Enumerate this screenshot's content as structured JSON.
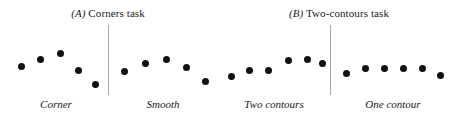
{
  "figure": {
    "panels": [
      {
        "id": "panel-a",
        "letter": "(A)",
        "title": " Corners task"
      },
      {
        "id": "panel-b",
        "letter": "(B)",
        "title": " Two-contours task"
      }
    ],
    "conditions": [
      {
        "id": "corner",
        "label": "Corner"
      },
      {
        "id": "smooth",
        "label": "Smooth"
      },
      {
        "id": "two-contours",
        "label": "Two contours"
      },
      {
        "id": "one-contour",
        "label": "One contour"
      }
    ],
    "dot_color": "#111111",
    "divider_color": "#a8a8a8",
    "background_color": "#ffffff"
  },
  "chart_data": {
    "type": "scatter",
    "xlabel": "",
    "ylabel": "",
    "grid": false,
    "legend": "none",
    "note": "Four dot-stimulus arrays; y measured downward in px from top of each 56px plot box (smaller y = higher on screen).",
    "xlim": [
      0,
      112
    ],
    "ylim": [
      0,
      56
    ],
    "series": [
      {
        "name": "Corner",
        "points": [
          {
            "x": 13,
            "y": 28
          },
          {
            "x": 32,
            "y": 21
          },
          {
            "x": 52,
            "y": 15
          },
          {
            "x": 70,
            "y": 32
          },
          {
            "x": 87,
            "y": 46
          }
        ]
      },
      {
        "name": "Smooth",
        "points": [
          {
            "x": 11,
            "y": 33
          },
          {
            "x": 32,
            "y": 25
          },
          {
            "x": 53,
            "y": 21
          },
          {
            "x": 73,
            "y": 29
          },
          {
            "x": 92,
            "y": 43
          }
        ]
      },
      {
        "name": "Two contours",
        "points": [
          {
            "x": 9,
            "y": 38
          },
          {
            "x": 27,
            "y": 32
          },
          {
            "x": 46,
            "y": 32
          },
          {
            "x": 66,
            "y": 22
          },
          {
            "x": 85,
            "y": 21
          },
          {
            "x": 100,
            "y": 25
          }
        ]
      },
      {
        "name": "One contour",
        "points": [
          {
            "x": 9,
            "y": 35
          },
          {
            "x": 28,
            "y": 30
          },
          {
            "x": 47,
            "y": 30
          },
          {
            "x": 66,
            "y": 30
          },
          {
            "x": 85,
            "y": 30
          },
          {
            "x": 103,
            "y": 37
          }
        ]
      }
    ]
  }
}
